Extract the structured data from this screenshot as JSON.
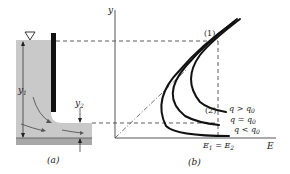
{
  "panel_a": {
    "caption": "(a)",
    "depth_upstream_label": "y",
    "depth_upstream_sub": "1",
    "depth_downstream_label": "y",
    "depth_downstream_sub": "2",
    "free_surface_symbol": "∇"
  },
  "panel_b": {
    "caption": "(b)",
    "y_axis_label": "y",
    "x_axis_label": "E",
    "point_1_label": "(1)",
    "point_2_label": "(2)",
    "energy_equal_label": {
      "E": "E",
      "sub1": "1",
      "eq": " = ",
      "E2": "E",
      "sub2": "2"
    },
    "curves": [
      {
        "label": "q > q",
        "sub": "0"
      },
      {
        "label": "q = q",
        "sub": "0"
      },
      {
        "label": "q < q",
        "sub": "0"
      }
    ]
  },
  "colors": {
    "water": "#c9c9c9",
    "bed": "#a8a8a8",
    "gate": "#111111",
    "ink": "#222222"
  }
}
